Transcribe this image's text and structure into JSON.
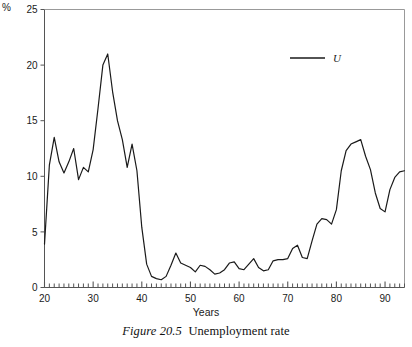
{
  "figure": {
    "caption_number": "Figure 20.5",
    "caption_text": "Unemployment rate",
    "unit_label": "%"
  },
  "chart_data": {
    "type": "line",
    "title": "",
    "subtitle": "",
    "xlabel": "Years",
    "ylabel": "%",
    "xlim": [
      20,
      94
    ],
    "ylim": [
      0,
      25
    ],
    "grid": false,
    "legend_position": "top-right",
    "xticks_major": [
      20,
      30,
      40,
      50,
      60,
      70,
      80,
      90
    ],
    "xticks_major_labels": [
      "20",
      "30",
      "40",
      "50",
      "60",
      "70",
      "80",
      "90"
    ],
    "xtick_minor_interval": 1,
    "yticks": [
      0,
      5,
      10,
      15,
      20,
      25
    ],
    "ytick_labels": [
      "0",
      "5",
      "10",
      "15",
      "20",
      "25"
    ],
    "annotations": [],
    "series": [
      {
        "name": "U",
        "legend_label": "U",
        "color": "#1a1a1a",
        "x": [
          20,
          21,
          22,
          23,
          24,
          25,
          26,
          27,
          28,
          29,
          30,
          31,
          32,
          33,
          34,
          35,
          36,
          37,
          38,
          39,
          40,
          41,
          42,
          43,
          44,
          45,
          46,
          47,
          48,
          49,
          50,
          51,
          52,
          53,
          54,
          55,
          56,
          57,
          58,
          59,
          60,
          61,
          62,
          63,
          64,
          65,
          66,
          67,
          68,
          69,
          70,
          71,
          72,
          73,
          74,
          75,
          76,
          77,
          78,
          79,
          80,
          81,
          82,
          83,
          84,
          85,
          86,
          87,
          88,
          89,
          90,
          91,
          92,
          93,
          94
        ],
        "values": [
          3.9,
          11.0,
          13.5,
          11.3,
          10.3,
          11.3,
          12.5,
          9.7,
          10.8,
          10.4,
          12.4,
          16.1,
          20.0,
          21.0,
          17.6,
          15.0,
          13.3,
          10.8,
          12.9,
          10.5,
          5.4,
          2.1,
          1.0,
          0.8,
          0.7,
          1.0,
          2.0,
          3.1,
          2.2,
          2.0,
          1.8,
          1.4,
          2.0,
          1.9,
          1.6,
          1.2,
          1.3,
          1.6,
          2.2,
          2.3,
          1.7,
          1.6,
          2.1,
          2.6,
          1.8,
          1.5,
          1.6,
          2.4,
          2.5,
          2.5,
          2.6,
          3.5,
          3.8,
          2.7,
          2.6,
          4.2,
          5.7,
          6.2,
          6.1,
          5.7,
          7.0,
          10.5,
          12.3,
          12.9,
          13.1,
          13.3,
          11.8,
          10.6,
          8.5,
          7.1,
          6.8,
          8.8,
          9.9,
          10.4,
          10.5
        ]
      }
    ]
  },
  "legend": {
    "items": [
      {
        "label": "U",
        "color": "#1a1a1a"
      }
    ]
  }
}
